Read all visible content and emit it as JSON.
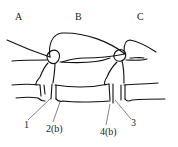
{
  "diagram": {
    "section_labels": [
      {
        "id": "A",
        "text": "A",
        "x": 15,
        "y": 12
      },
      {
        "id": "B",
        "text": "B",
        "x": 75,
        "y": 12
      },
      {
        "id": "C",
        "text": "C",
        "x": 137,
        "y": 12
      }
    ],
    "callouts": [
      {
        "id": "1",
        "text": "1",
        "x": 24,
        "y": 120,
        "target": [
          51,
          98
        ]
      },
      {
        "id": "2b",
        "text": "2(b)",
        "x": 46,
        "y": 124,
        "target": [
          60,
          101
        ]
      },
      {
        "id": "4b",
        "text": "4(b)",
        "x": 100,
        "y": 127,
        "target": [
          110,
          104
        ]
      },
      {
        "id": "3",
        "text": "3",
        "x": 131,
        "y": 118,
        "target": [
          115,
          99
        ]
      }
    ],
    "line_color": "#111111",
    "background": "#ffffff"
  }
}
